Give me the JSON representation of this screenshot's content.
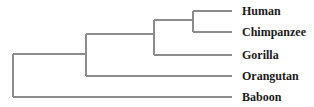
{
  "diagram": {
    "type": "phylogenetic-tree",
    "line_color": "#8c8c8c",
    "text_color": "#1a1a1a",
    "leaves": [
      {
        "label": "Human",
        "y": 11
      },
      {
        "label": "Chimpanzee",
        "y": 32
      },
      {
        "label": "Gorilla",
        "y": 55
      },
      {
        "label": "Orangutan",
        "y": 76
      },
      {
        "label": "Baboon",
        "y": 97
      }
    ],
    "newick": "((((Human,Chimpanzee),Gorilla),Orangutan),Baboon);"
  }
}
